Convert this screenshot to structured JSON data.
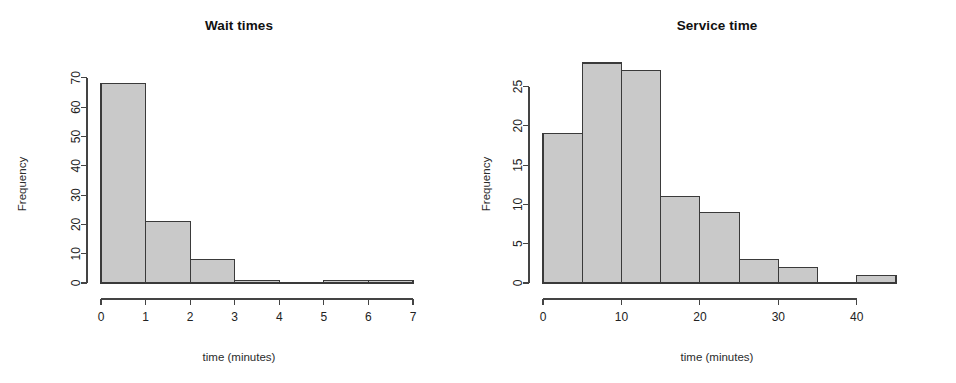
{
  "figure": {
    "background_color": "#ffffff",
    "bar_fill_color": "#c9c9c9",
    "bar_border_color": "#3a3a3a",
    "axis_color": "#444444",
    "text_color": "#222222",
    "panel_count": 2
  },
  "panels": [
    {
      "title": "Wait times",
      "xlabel": "time (minutes)",
      "ylabel": "Frequency",
      "x_ticks": [
        "0",
        "1",
        "2",
        "3",
        "4",
        "5",
        "6",
        "7"
      ],
      "y_ticks": [
        "0",
        "10",
        "20",
        "30",
        "40",
        "50",
        "60",
        "70"
      ]
    },
    {
      "title": "Service time",
      "xlabel": "time (minutes)",
      "ylabel": "Frequency",
      "x_ticks": [
        "0",
        "10",
        "20",
        "30",
        "40"
      ],
      "y_ticks": [
        "0",
        "5",
        "10",
        "15",
        "20",
        "25"
      ]
    }
  ],
  "chart_data": [
    {
      "type": "bar",
      "subtype": "histogram",
      "title": "Wait times",
      "xlabel": "time (minutes)",
      "ylabel": "Frequency",
      "bin_width": 1,
      "bin_edges": [
        0,
        1,
        2,
        3,
        4,
        5,
        6,
        7
      ],
      "categories": [
        "0-1",
        "1-2",
        "2-3",
        "3-4",
        "4-5",
        "5-6",
        "6-7"
      ],
      "values": [
        68,
        21,
        8,
        1,
        0,
        1,
        1
      ],
      "xlim": [
        0,
        7
      ],
      "ylim": [
        0,
        72
      ],
      "x_ticks": [
        0,
        1,
        2,
        3,
        4,
        5,
        6,
        7
      ],
      "y_ticks": [
        0,
        10,
        20,
        30,
        40,
        50,
        60,
        70
      ],
      "grid": false,
      "legend": false
    },
    {
      "type": "bar",
      "subtype": "histogram",
      "title": "Service time",
      "xlabel": "time (minutes)",
      "ylabel": "Frequency",
      "bin_width": 5,
      "bin_edges": [
        0,
        5,
        10,
        15,
        20,
        25,
        30,
        35,
        40,
        45
      ],
      "categories": [
        "0-5",
        "5-10",
        "10-15",
        "15-20",
        "20-25",
        "25-30",
        "30-35",
        "35-40",
        "40-45"
      ],
      "values": [
        19,
        28,
        27,
        11,
        9,
        3,
        2,
        0,
        1
      ],
      "xlim": [
        0,
        45
      ],
      "ylim": [
        0,
        28
      ],
      "x_ticks": [
        0,
        10,
        20,
        30,
        40
      ],
      "y_ticks": [
        0,
        5,
        10,
        15,
        20,
        25
      ],
      "grid": false,
      "legend": false
    }
  ]
}
